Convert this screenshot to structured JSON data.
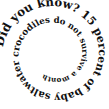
{
  "image": {
    "kind": "spiral-text-graphic",
    "width": 109,
    "height": 109,
    "background_color": "#ffffff",
    "text_color": "#111111",
    "font_style": "bold-serif"
  },
  "spiral": {
    "full_text": "Did you know? 15 percent of baby saltwater crocodiles do not survive a month",
    "direction": "clockwise-inward",
    "segments": [
      {
        "label": "lead-in",
        "text": "Did you know?"
      },
      {
        "label": "statistic",
        "text": "15 percent of baby saltwater crocodiles"
      },
      {
        "label": "claim",
        "text": "do not survive a month"
      }
    ],
    "words": [
      "Did",
      "you",
      "know?",
      "15",
      "percent",
      "of",
      "baby",
      "saltwater",
      "crocodiles",
      "do",
      "not",
      "survive",
      "a",
      "month"
    ],
    "characters": "Did you know? 15 percent of baby saltwater crocodiles do not survive a month",
    "start_angle_deg": 188,
    "turns": 2.35,
    "outer_radius": 52,
    "inner_radius": 13,
    "outer_font_size": 12.2,
    "inner_font_size": 5.2,
    "center": {
      "x": 54.5,
      "y": 54.5
    }
  }
}
